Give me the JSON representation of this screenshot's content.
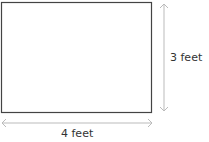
{
  "diagram": {
    "shape": "rectangle",
    "width_label": "4 feet",
    "height_label": "3 feet",
    "colors": {
      "outline": "#444444",
      "arrow": "#bbbbbb",
      "text": "#333333"
    }
  }
}
